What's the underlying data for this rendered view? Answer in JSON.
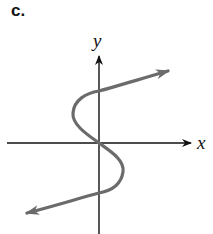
{
  "figure": {
    "panel_label": "c.",
    "x_axis_label": "x",
    "y_axis_label": "y",
    "colors": {
      "axis": "#111111",
      "curve": "#6b6b6b",
      "background": "#ffffff"
    }
  }
}
